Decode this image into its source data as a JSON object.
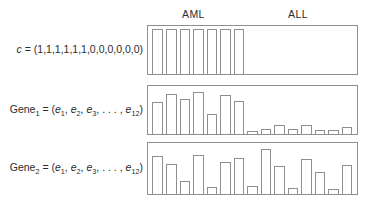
{
  "figure": {
    "headers": [
      {
        "name": "aml",
        "label": "AML"
      },
      {
        "name": "all",
        "label": "ALL"
      }
    ],
    "rows": [
      {
        "name": "c",
        "label_prefix": "c",
        "label_eq": " = (",
        "label_body": "1,1,1,1,1,1,0,0,0,0,0,0",
        "label_suffix": ")",
        "label_full": "c = (1,1,1,1,1,1,0,0,0,0,0,0)"
      },
      {
        "name": "gene1",
        "label_prefix": "Gene",
        "label_sub": "1",
        "label_eq": " = (",
        "label_body": "e1, e2, e3, . . . , e12",
        "label_suffix": ")",
        "label_full": "Gene1 = (e1, e2, e3, . . . , e12)"
      },
      {
        "name": "gene2",
        "label_prefix": "Gene",
        "label_sub": "2",
        "label_eq": " = (",
        "label_body": "e1, e2, e3, . . . , e12",
        "label_suffix": ")",
        "label_full": "Gene2 = (e1, e2, e3, . . . , e12)"
      }
    ]
  },
  "chart_data": [
    {
      "type": "bar",
      "name": "class-vector-c",
      "title": "c = (1,1,1,1,1,1,0,0,0,0,0,0)",
      "xlabel": "",
      "ylabel": "",
      "ylim": [
        0,
        1
      ],
      "grid": false,
      "legend": "none",
      "categories": [
        "s1",
        "s2",
        "s3",
        "s4",
        "s5",
        "s6",
        "s7",
        "s8",
        "s9",
        "s10",
        "s11",
        "s12",
        "s13",
        "s14",
        "s15"
      ],
      "groups": [
        "AML",
        "AML",
        "AML",
        "AML",
        "AML",
        "AML",
        "AML",
        "ALL",
        "ALL",
        "ALL",
        "ALL",
        "ALL",
        "ALL",
        "ALL",
        "ALL"
      ],
      "values": [
        1,
        1,
        1,
        1,
        1,
        1,
        1,
        0,
        0,
        0,
        0,
        0,
        0,
        0,
        0
      ]
    },
    {
      "type": "bar",
      "name": "gene1-expression",
      "title": "Gene1 = (e1, e2, e3, . . . , e12)",
      "xlabel": "",
      "ylabel": "",
      "ylim": [
        0,
        1
      ],
      "grid": false,
      "legend": "none",
      "categories": [
        "s1",
        "s2",
        "s3",
        "s4",
        "s5",
        "s6",
        "s7",
        "s8",
        "s9",
        "s10",
        "s11",
        "s12",
        "s13",
        "s14",
        "s15"
      ],
      "groups": [
        "AML",
        "AML",
        "AML",
        "AML",
        "AML",
        "AML",
        "AML",
        "ALL",
        "ALL",
        "ALL",
        "ALL",
        "ALL",
        "ALL",
        "ALL",
        "ALL"
      ],
      "values": [
        0.72,
        0.9,
        0.78,
        0.94,
        0.44,
        0.86,
        0.73,
        0.07,
        0.12,
        0.21,
        0.11,
        0.19,
        0.1,
        0.08,
        0.15
      ]
    },
    {
      "type": "bar",
      "name": "gene2-expression",
      "title": "Gene2 = (e1, e2, e3, . . . , e12)",
      "xlabel": "",
      "ylabel": "",
      "ylim": [
        0,
        1
      ],
      "grid": false,
      "legend": "none",
      "categories": [
        "s1",
        "s2",
        "s3",
        "s4",
        "s5",
        "s6",
        "s7",
        "s8",
        "s9",
        "s10",
        "s11",
        "s12",
        "s13",
        "s14",
        "s15"
      ],
      "groups": [
        "AML",
        "AML",
        "AML",
        "AML",
        "AML",
        "AML",
        "AML",
        "ALL",
        "ALL",
        "ALL",
        "ALL",
        "ALL",
        "ALL",
        "ALL",
        "ALL"
      ],
      "values": [
        0.8,
        0.62,
        0.27,
        0.82,
        0.14,
        0.66,
        0.76,
        0.16,
        0.93,
        0.58,
        0.13,
        0.72,
        0.45,
        0.11,
        0.6
      ]
    }
  ]
}
